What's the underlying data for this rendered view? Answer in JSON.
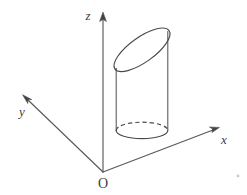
{
  "figure": {
    "background_color": "#ffffff",
    "line_color": "#4a4a4a",
    "label_color": "#3d3d3d",
    "labels": {
      "z_axis": "z",
      "y_axis": "y",
      "x_axis": "x",
      "origin": "O"
    },
    "axes": [
      {
        "name": "z-axis",
        "label": "z",
        "direction": "up",
        "from": [
          103,
          172
        ],
        "to": [
          103,
          16
        ],
        "arrow": true
      },
      {
        "name": "y-axis",
        "label": "y",
        "direction": "upper-left",
        "from": [
          103,
          172
        ],
        "to": [
          24,
          96
        ],
        "arrow": true
      },
      {
        "name": "x-axis",
        "label": "x",
        "direction": "upper-right",
        "from": [
          103,
          172
        ],
        "to": [
          218,
          128
        ],
        "arrow": true
      }
    ],
    "solid_shape": {
      "name": "cylinder",
      "description": "vertical right circular cylinder cut by an oblique plane at the top",
      "left_wall_x": 116,
      "right_wall_x": 168,
      "bottom_center": [
        142,
        130
      ],
      "bottom_radius_x": 26,
      "bottom_radius_y": 8,
      "top_cut": "oblique ellipse, low at left (116,68) and high at right (168,31)",
      "hidden_edges": "dashed back arc of bottom base"
    }
  }
}
